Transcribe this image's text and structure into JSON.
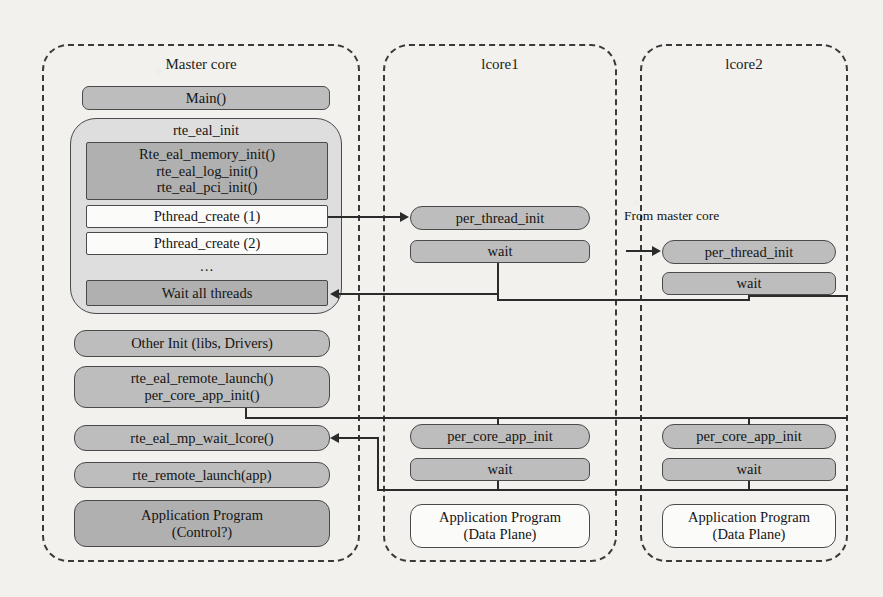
{
  "diagram": {
    "columns": [
      {
        "id": "master",
        "label": "Master core"
      },
      {
        "id": "lcore1",
        "label": "lcore1"
      },
      {
        "id": "lcore2",
        "label": "lcore2"
      }
    ],
    "master": {
      "main": "Main()",
      "eal_group_label": "rte_eal_init",
      "eal_inits": "Rte_eal_memory_init()\nrte_eal_log_init()\nrte_eal_pci_init()",
      "pthread_create_1": "Pthread_create (1)",
      "pthread_create_2": "Pthread_create (2)",
      "ellipsis": "...",
      "wait_all_threads": "Wait all threads",
      "other_init": "Other Init (libs, Drivers)",
      "remote_launch": "rte_eal_remote_launch()\nper_core_app_init()",
      "mp_wait_lcore": "rte_eal_mp_wait_lcore()",
      "rte_remote_launch": "rte_remote_launch(app)",
      "app_program": "Application Program\n(Control?)"
    },
    "lcore1": {
      "per_thread_init": "per_thread_init",
      "wait_top": "wait",
      "per_core_app_init": "per_core_app_init",
      "wait_bottom": "wait",
      "app_program": "Application Program\n(Data Plane)"
    },
    "lcore2": {
      "from_master_note": "From master core",
      "per_thread_init": "per_thread_init",
      "wait_top": "wait",
      "per_core_app_init": "per_core_app_init",
      "wait_bottom": "wait",
      "app_program": "Application Program\n(Data Plane)"
    },
    "colors": {
      "background": "#f2f1ed",
      "box_fill": "#bdbdbd",
      "box_fill_dark": "#b0b0b0",
      "box_fill_light": "#dedede",
      "box_fill_white": "#fbfbfa",
      "stroke": "#4a4a4a",
      "connector": "#2b2b2b",
      "text": "#141414"
    }
  }
}
